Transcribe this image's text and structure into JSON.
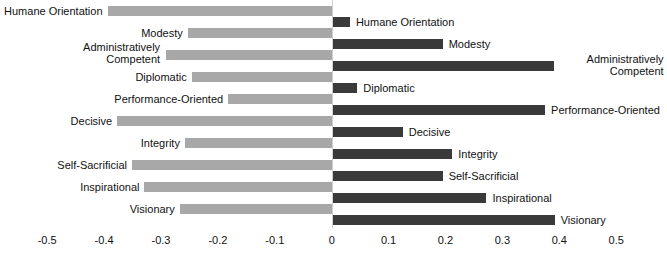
{
  "chart_data": {
    "type": "bar",
    "orientation": "horizontal",
    "title": "",
    "subtitle": "",
    "xlabel": "",
    "ylabel": "",
    "xlim": [
      -0.5,
      0.5
    ],
    "grid": false,
    "legend": "none",
    "zero_reference": 0,
    "tick_labels": [
      "-0.5",
      "-0.4",
      "-0.3",
      "-0.2",
      "-0.1",
      "0",
      "0.1",
      "0.2",
      "0.3",
      "0.4",
      "0.5"
    ],
    "tick_values": [
      -0.5,
      -0.4,
      -0.3,
      -0.2,
      -0.1,
      0,
      0.1,
      0.2,
      0.3,
      0.4,
      0.5
    ],
    "categories": [
      "Humane Orientation",
      "Modesty",
      "Administratively Competent",
      "Diplomatic",
      "Performance-Oriented",
      "Decisive",
      "Integrity",
      "Self-Sacrificial",
      "Inspirational",
      "Visionary"
    ],
    "series": [
      {
        "name": "negative",
        "color": "#a8a8a8",
        "values": [
          -0.394,
          -0.253,
          -0.291,
          -0.246,
          -0.182,
          -0.377,
          -0.258,
          -0.351,
          -0.329,
          -0.267
        ]
      },
      {
        "name": "positive",
        "color": "#3a3a3a",
        "values": [
          0.032,
          0.195,
          0.39,
          0.045,
          0.375,
          0.125,
          0.212,
          0.195,
          0.272,
          0.392
        ]
      }
    ],
    "rows": [
      {
        "label": "Humane Orientation",
        "label_lines": [
          "Humane Orientation"
        ],
        "negative": -0.394,
        "positive": 0.032
      },
      {
        "label": "Modesty",
        "label_lines": [
          "Modesty"
        ],
        "negative": -0.253,
        "positive": 0.195
      },
      {
        "label": "Administratively Competent",
        "label_lines": [
          "Administratively",
          "Competent"
        ],
        "negative": -0.291,
        "positive": 0.39
      },
      {
        "label": "Diplomatic",
        "label_lines": [
          "Diplomatic"
        ],
        "negative": -0.246,
        "positive": 0.045
      },
      {
        "label": "Performance-Oriented",
        "label_lines": [
          "Performance-Oriented"
        ],
        "negative": -0.182,
        "positive": 0.375
      },
      {
        "label": "Decisive",
        "label_lines": [
          "Decisive"
        ],
        "negative": -0.377,
        "positive": 0.125
      },
      {
        "label": "Integrity",
        "label_lines": [
          "Integrity"
        ],
        "negative": -0.258,
        "positive": 0.212
      },
      {
        "label": "Self-Sacrificial",
        "label_lines": [
          "Self-Sacrificial"
        ],
        "negative": -0.351,
        "positive": 0.195
      },
      {
        "label": "Inspirational",
        "label_lines": [
          "Inspirational"
        ],
        "negative": -0.329,
        "positive": 0.272
      },
      {
        "label": "Visionary",
        "label_lines": [
          "Visionary"
        ],
        "negative": -0.267,
        "positive": 0.392
      }
    ]
  },
  "style": {
    "negative_color": "#a8a8a8",
    "positive_color": "#3a3a3a",
    "text_color": "#111111",
    "background": "#ffffff"
  }
}
